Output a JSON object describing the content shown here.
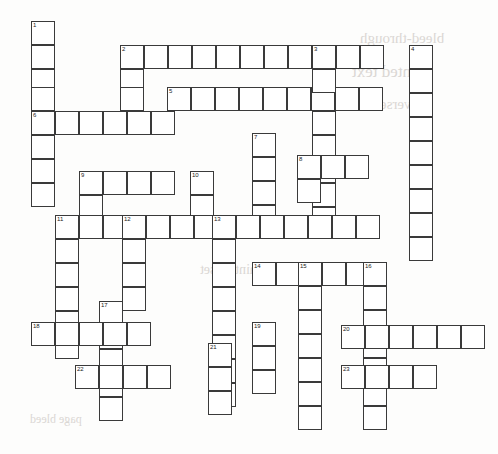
{
  "puzzle": {
    "type": "crossword-grid",
    "title": "",
    "cell_size": 24,
    "origin": {
      "x": 31,
      "y": 21
    },
    "grid_columns": 19,
    "grid_rows": 18,
    "ink_color": "#3a3a3a",
    "cell_fill": "#ffffff",
    "page_color": "#fdfdfc",
    "number_font_size": 6,
    "clue_numbers": [
      1,
      2,
      3,
      4,
      5,
      6,
      7,
      8,
      9,
      10,
      11,
      12,
      13,
      14,
      15,
      16,
      17,
      18,
      19,
      20,
      21,
      22,
      23
    ],
    "entries": [
      {
        "number": 1,
        "direction": "down",
        "col": 0,
        "row": 0,
        "length": 8
      },
      {
        "number": 2,
        "direction": "across",
        "col": 4,
        "row": 1,
        "length": 11
      },
      {
        "number": 2,
        "direction": "down",
        "col": 4,
        "row": 1,
        "length": 4
      },
      {
        "number": 3,
        "direction": "down",
        "col": 12,
        "row": 1,
        "length": 9
      },
      {
        "number": 4,
        "direction": "down",
        "col": 16,
        "row": 1,
        "length": 9
      },
      {
        "number": 5,
        "direction": "across",
        "col": 6,
        "row": 3,
        "length": 10
      },
      {
        "number": 6,
        "direction": "across",
        "col": 0,
        "row": 4,
        "length": 6
      },
      {
        "number": 7,
        "direction": "down",
        "col": 9,
        "row": 5,
        "length": 6
      },
      {
        "number": 8,
        "direction": "across",
        "col": 11,
        "row": 6,
        "length": 3
      },
      {
        "number": 8,
        "direction": "down",
        "col": 11,
        "row": 6,
        "length": 3
      },
      {
        "number": 9,
        "direction": "across",
        "col": 2,
        "row": 7,
        "length": 4
      },
      {
        "number": 9,
        "direction": "down",
        "col": 2,
        "row": 7,
        "length": 9
      },
      {
        "number": 10,
        "direction": "down",
        "col": 6,
        "row": 7,
        "length": 3
      },
      {
        "number": 11,
        "direction": "across",
        "col": 1,
        "row": 9,
        "length": 14
      },
      {
        "number": 11,
        "direction": "down",
        "col": 1,
        "row": 9,
        "length": 6
      },
      {
        "number": 12,
        "direction": "down",
        "col": 4,
        "row": 9,
        "length": 5
      },
      {
        "number": 13,
        "direction": "down",
        "col": 8,
        "row": 9,
        "length": 8
      },
      {
        "number": 14,
        "direction": "across",
        "col": 9,
        "row": 11,
        "length": 6
      },
      {
        "number": 15,
        "direction": "down",
        "col": 11,
        "row": 11,
        "length": 8
      },
      {
        "number": 16,
        "direction": "down",
        "col": 14,
        "row": 11,
        "length": 8
      },
      {
        "number": 17,
        "direction": "down",
        "col": 3,
        "row": 13,
        "length": 5
      },
      {
        "number": 18,
        "direction": "across",
        "col": 0,
        "row": 14,
        "length": 5
      },
      {
        "number": 19,
        "direction": "down",
        "col": 9,
        "row": 15,
        "length": 3
      },
      {
        "number": 20,
        "direction": "across",
        "col": 13,
        "row": 15,
        "length": 6
      },
      {
        "number": 21,
        "direction": "across",
        "col": 7,
        "row": 16,
        "length": 3
      },
      {
        "number": 22,
        "direction": "across",
        "col": 2,
        "row": 17,
        "length": 4
      },
      {
        "number": 23,
        "direction": "across",
        "col": 13,
        "row": 17,
        "length": 4
      }
    ],
    "cells": [
      {
        "x": 31,
        "y": 21,
        "n": "1"
      },
      {
        "x": 31,
        "y": 45
      },
      {
        "x": 31,
        "y": 69
      },
      {
        "x": 31,
        "y": 87
      },
      {
        "x": 31,
        "y": 111,
        "n": "6"
      },
      {
        "x": 55,
        "y": 111
      },
      {
        "x": 79,
        "y": 111
      },
      {
        "x": 103,
        "y": 111
      },
      {
        "x": 127,
        "y": 111
      },
      {
        "x": 151,
        "y": 111
      },
      {
        "x": 31,
        "y": 135
      },
      {
        "x": 31,
        "y": 159
      },
      {
        "x": 31,
        "y": 183
      },
      {
        "x": 120,
        "y": 45,
        "n": "2"
      },
      {
        "x": 144,
        "y": 45
      },
      {
        "x": 168,
        "y": 45
      },
      {
        "x": 192,
        "y": 45
      },
      {
        "x": 216,
        "y": 45
      },
      {
        "x": 240,
        "y": 45
      },
      {
        "x": 264,
        "y": 45
      },
      {
        "x": 288,
        "y": 45
      },
      {
        "x": 312,
        "y": 45,
        "n": "3"
      },
      {
        "x": 336,
        "y": 45
      },
      {
        "x": 360,
        "y": 45
      },
      {
        "x": 120,
        "y": 69
      },
      {
        "x": 120,
        "y": 87
      },
      {
        "x": 167,
        "y": 87,
        "n": "5"
      },
      {
        "x": 191,
        "y": 87
      },
      {
        "x": 215,
        "y": 87
      },
      {
        "x": 239,
        "y": 87
      },
      {
        "x": 263,
        "y": 87
      },
      {
        "x": 287,
        "y": 87
      },
      {
        "x": 311,
        "y": 87
      },
      {
        "x": 335,
        "y": 87
      },
      {
        "x": 359,
        "y": 87
      },
      {
        "x": 312,
        "y": 69
      },
      {
        "x": 312,
        "y": 111
      },
      {
        "x": 312,
        "y": 135
      },
      {
        "x": 312,
        "y": 159
      },
      {
        "x": 312,
        "y": 183
      },
      {
        "x": 312,
        "y": 207
      },
      {
        "x": 409,
        "y": 45,
        "n": "4"
      },
      {
        "x": 409,
        "y": 69
      },
      {
        "x": 409,
        "y": 93
      },
      {
        "x": 409,
        "y": 117
      },
      {
        "x": 409,
        "y": 141
      },
      {
        "x": 409,
        "y": 165
      },
      {
        "x": 409,
        "y": 189
      },
      {
        "x": 409,
        "y": 213
      },
      {
        "x": 409,
        "y": 237
      },
      {
        "x": 252,
        "y": 133,
        "n": "7"
      },
      {
        "x": 252,
        "y": 157
      },
      {
        "x": 252,
        "y": 181
      },
      {
        "x": 252,
        "y": 205
      },
      {
        "x": 297,
        "y": 155,
        "n": "8"
      },
      {
        "x": 321,
        "y": 155
      },
      {
        "x": 345,
        "y": 155
      },
      {
        "x": 297,
        "y": 179
      },
      {
        "x": 79,
        "y": 171,
        "n": "9"
      },
      {
        "x": 103,
        "y": 171
      },
      {
        "x": 127,
        "y": 171
      },
      {
        "x": 151,
        "y": 171
      },
      {
        "x": 79,
        "y": 195
      },
      {
        "x": 190,
        "y": 171,
        "n": "10"
      },
      {
        "x": 190,
        "y": 195
      },
      {
        "x": 55,
        "y": 215,
        "n": "11"
      },
      {
        "x": 79,
        "y": 215
      },
      {
        "x": 103,
        "y": 215
      },
      {
        "x": 122,
        "y": 215,
        "n": "12"
      },
      {
        "x": 146,
        "y": 215
      },
      {
        "x": 170,
        "y": 215
      },
      {
        "x": 194,
        "y": 215
      },
      {
        "x": 212,
        "y": 215,
        "n": "13"
      },
      {
        "x": 236,
        "y": 215
      },
      {
        "x": 260,
        "y": 215
      },
      {
        "x": 284,
        "y": 215
      },
      {
        "x": 308,
        "y": 215
      },
      {
        "x": 332,
        "y": 215
      },
      {
        "x": 356,
        "y": 215
      },
      {
        "x": 55,
        "y": 239
      },
      {
        "x": 55,
        "y": 263
      },
      {
        "x": 55,
        "y": 287
      },
      {
        "x": 55,
        "y": 311
      },
      {
        "x": 55,
        "y": 335
      },
      {
        "x": 122,
        "y": 239
      },
      {
        "x": 122,
        "y": 263
      },
      {
        "x": 122,
        "y": 287
      },
      {
        "x": 212,
        "y": 239
      },
      {
        "x": 212,
        "y": 263
      },
      {
        "x": 212,
        "y": 287
      },
      {
        "x": 212,
        "y": 311
      },
      {
        "x": 212,
        "y": 335
      },
      {
        "x": 212,
        "y": 359
      },
      {
        "x": 212,
        "y": 383
      },
      {
        "x": 252,
        "y": 262,
        "n": "14"
      },
      {
        "x": 276,
        "y": 262
      },
      {
        "x": 298,
        "y": 262,
        "n": "15"
      },
      {
        "x": 322,
        "y": 262
      },
      {
        "x": 346,
        "y": 262
      },
      {
        "x": 363,
        "y": 262,
        "n": "16"
      },
      {
        "x": 298,
        "y": 286
      },
      {
        "x": 298,
        "y": 310
      },
      {
        "x": 298,
        "y": 334
      },
      {
        "x": 298,
        "y": 358
      },
      {
        "x": 298,
        "y": 382
      },
      {
        "x": 298,
        "y": 406
      },
      {
        "x": 363,
        "y": 286
      },
      {
        "x": 363,
        "y": 310
      },
      {
        "x": 363,
        "y": 334
      },
      {
        "x": 363,
        "y": 358
      },
      {
        "x": 363,
        "y": 382
      },
      {
        "x": 363,
        "y": 406
      },
      {
        "x": 99,
        "y": 301,
        "n": "17"
      },
      {
        "x": 99,
        "y": 325
      },
      {
        "x": 99,
        "y": 349
      },
      {
        "x": 99,
        "y": 373
      },
      {
        "x": 99,
        "y": 397
      },
      {
        "x": 31,
        "y": 322,
        "n": "18"
      },
      {
        "x": 55,
        "y": 322
      },
      {
        "x": 79,
        "y": 322
      },
      {
        "x": 103,
        "y": 322
      },
      {
        "x": 127,
        "y": 322
      },
      {
        "x": 252,
        "y": 322,
        "n": "19"
      },
      {
        "x": 252,
        "y": 346
      },
      {
        "x": 252,
        "y": 370
      },
      {
        "x": 341,
        "y": 325,
        "n": "20"
      },
      {
        "x": 365,
        "y": 325
      },
      {
        "x": 389,
        "y": 325
      },
      {
        "x": 413,
        "y": 325
      },
      {
        "x": 437,
        "y": 325
      },
      {
        "x": 461,
        "y": 325
      },
      {
        "x": 208,
        "y": 343,
        "n": "21"
      },
      {
        "x": 208,
        "y": 367
      },
      {
        "x": 208,
        "y": 391
      },
      {
        "x": 75,
        "y": 365,
        "n": "22"
      },
      {
        "x": 99,
        "y": 365
      },
      {
        "x": 123,
        "y": 365
      },
      {
        "x": 147,
        "y": 365
      },
      {
        "x": 341,
        "y": 365,
        "n": "23"
      },
      {
        "x": 365,
        "y": 365
      },
      {
        "x": 389,
        "y": 365
      },
      {
        "x": 413,
        "y": 365
      }
    ]
  },
  "background_bleed": [
    {
      "x": 360,
      "y": 30,
      "size": 15,
      "text": "bleed-through"
    },
    {
      "x": 352,
      "y": 62,
      "size": 17,
      "text": "printed text"
    },
    {
      "x": 352,
      "y": 96,
      "size": 15,
      "text": "reverse side"
    },
    {
      "x": 200,
      "y": 262,
      "size": 14,
      "text": "faint offset"
    },
    {
      "x": 30,
      "y": 412,
      "size": 12,
      "text": "page bleed"
    }
  ]
}
